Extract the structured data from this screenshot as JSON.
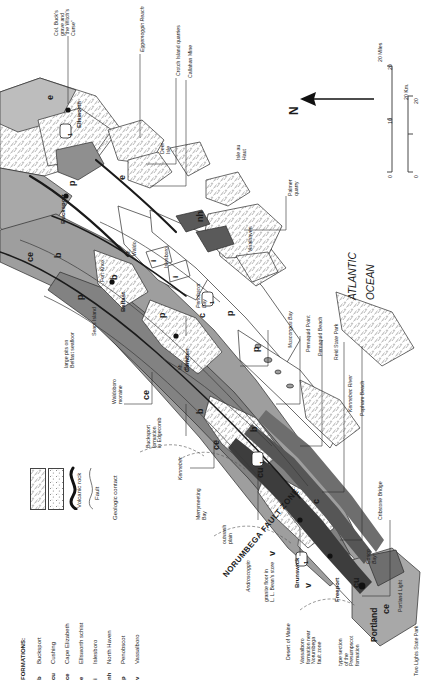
{
  "figure": {
    "type": "geologic-map",
    "region": "Coastal Maine",
    "orientation_note": "North points to the left; all labels rotated 90 degrees counter-clockwise"
  },
  "compass": {
    "label": "N",
    "icon": "north-arrow-icon",
    "direction": "left"
  },
  "scale": {
    "miles": {
      "ticks": [
        "0",
        "10",
        "20"
      ],
      "unit": "20 Miles"
    },
    "km": {
      "ticks": [
        "0",
        "",
        "20"
      ],
      "unit": "20 Km."
    }
  },
  "legend": {
    "title": "FORMATIONS:",
    "formations": [
      {
        "symbol": "b",
        "name": "Bucksport"
      },
      {
        "symbol": "cu",
        "name": "Cushing"
      },
      {
        "symbol": "ce",
        "name": "Cape Elizabeth"
      },
      {
        "symbol": "e",
        "name": "Ellsworth schist"
      },
      {
        "symbol": "i",
        "name": "Islesboro"
      },
      {
        "symbol": "nh",
        "name": "North Haven"
      },
      {
        "symbol": "p",
        "name": "Penobscot"
      },
      {
        "symbol": "v",
        "name": "Vassalboro"
      }
    ],
    "patterns": [
      {
        "swatch": "pluton-pattern",
        "label": "Pluton"
      },
      {
        "swatch": "volcanic-pattern",
        "label": "Volcanic rock"
      },
      {
        "swatch": "fault-line",
        "label": "Fault"
      },
      {
        "swatch": "contact-line",
        "label": "Geologic contact"
      }
    ]
  },
  "ocean_label": {
    "line1": "ATLANTIC",
    "line2": "OCEAN"
  },
  "cities": [
    {
      "name": "Ellsworth"
    },
    {
      "name": "Bucksport"
    },
    {
      "name": "Belfast"
    },
    {
      "name": "Camden"
    },
    {
      "name": "Brunswick"
    },
    {
      "name": "Freeport"
    },
    {
      "name": "Portland"
    }
  ],
  "places": [
    {
      "name": "Col. Buck's\ngrave and\n\"the Witch's\nCurse\""
    },
    {
      "name": "Eggemoggin Reach"
    },
    {
      "name": "Crotch Island quarries"
    },
    {
      "name": "Callahan Mine"
    },
    {
      "name": "Deer\nIsle"
    },
    {
      "name": "Isle au\nHaut"
    },
    {
      "name": "Palmer\nquarry"
    },
    {
      "name": "Vinalhaven"
    },
    {
      "name": "Islesboro"
    },
    {
      "name": "Penobscot\nBay"
    },
    {
      "name": "Mt.\nWaldo"
    },
    {
      "name": "Fort Knox"
    },
    {
      "name": "Sears Island"
    },
    {
      "name": "large pits on\nBelfast seafloor"
    },
    {
      "name": "Mt.\nBattie"
    },
    {
      "name": "Waldoboro\nmoraine"
    },
    {
      "name": "Bucksport\nformation\nin Edgecomb"
    },
    {
      "name": "Muscongus Bay"
    },
    {
      "name": "Pemaquid Point"
    },
    {
      "name": "Pemaquid Beach"
    },
    {
      "name": "Reid State Park"
    },
    {
      "name": "Kennebec River"
    },
    {
      "name": "Popham Beach"
    },
    {
      "name": "Cribstone Bridge"
    },
    {
      "name": "Kennebec"
    },
    {
      "name": "Merrymeeting\nBay"
    },
    {
      "name": "outwash\nplain"
    },
    {
      "name": "Androscoggin"
    },
    {
      "name": "Casco\nBay"
    },
    {
      "name": "Portland Light"
    },
    {
      "name": "Two Lights State Park"
    },
    {
      "name": "Desert of Maine"
    },
    {
      "name": "Vassalboro\nformation near\nNorumbega\nfault zone"
    },
    {
      "name": "granite floor in\nL. L. Bean's store"
    },
    {
      "name": "type section\nof the\nPresumpscot\nformation"
    }
  ],
  "fault_zone_label": "NORUMBEGA FAULT ZONE",
  "route_markers": [
    "1",
    "1",
    "1",
    "1"
  ],
  "unit_labels_on_map": [
    "e",
    "e",
    "b",
    "b",
    "b",
    "b",
    "p",
    "p",
    "p",
    "p",
    "p",
    "ce",
    "ce",
    "ce",
    "ce",
    "cu",
    "cu",
    "c",
    "c",
    "nh",
    "i",
    "i",
    "v",
    "v",
    "1"
  ],
  "colors": {
    "pluton_fill": "#ffffff",
    "bedrock_gray": "#a8a8a8",
    "dark_gray": "#6e6e6e",
    "darkest": "#3d3d3d",
    "light_gray": "#d4d4d4",
    "water": "#ffffff",
    "line": "#2b2b2b"
  }
}
